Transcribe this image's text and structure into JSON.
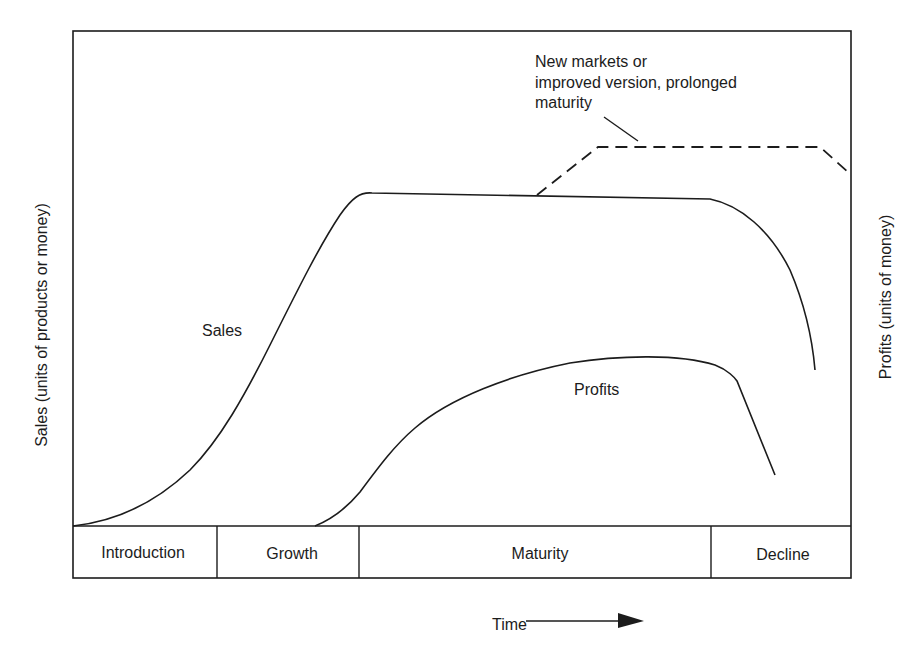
{
  "diagram": {
    "y_axis_left_label": "Sales (units of products or money)",
    "y_axis_right_label": "Profits (units of money)",
    "x_axis_label": "Time",
    "x_axis_arrow_icon": "right-arrow-icon",
    "stages": [
      {
        "label": "Introduction"
      },
      {
        "label": "Growth"
      },
      {
        "label": "Maturity"
      },
      {
        "label": "Decline"
      }
    ],
    "curves": {
      "sales": {
        "label": "Sales",
        "style": "solid"
      },
      "profits": {
        "label": "Profits",
        "style": "solid"
      },
      "extension": {
        "style": "dashed"
      }
    },
    "annotation": {
      "lines": [
        "New markets or",
        "improved version, prolonged",
        "maturity"
      ]
    },
    "colors": {
      "ink": "#1c1c1c",
      "background": "#ffffff"
    }
  }
}
